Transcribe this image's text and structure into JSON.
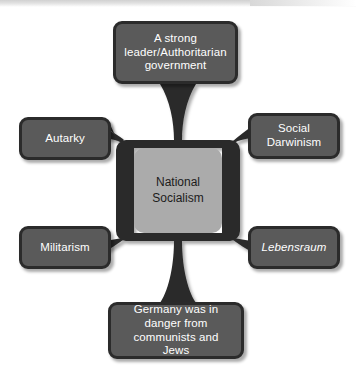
{
  "diagram": {
    "type": "spider-mind-map",
    "center": {
      "label": "National\nSocialism",
      "line1": "National",
      "line2": "Socialism",
      "fill_color": "#ababab",
      "text_color": "#1c1c1c"
    },
    "node_style": {
      "fill_color": "#5a5a5a",
      "border_color": "#2b2b2b",
      "text_color": "#ffffff"
    },
    "background_color": "#ffffff",
    "nodes": [
      {
        "id": "top",
        "position": "top",
        "label": "A strong leader/Authoritarian government",
        "lines": [
          "A strong",
          "leader/Authoritarian",
          "government"
        ],
        "italic": false
      },
      {
        "id": "left-upper",
        "position": "left-upper",
        "label": "Autarky",
        "lines": [
          "Autarky"
        ],
        "italic": false
      },
      {
        "id": "right-upper",
        "position": "right-upper",
        "label": "Social Darwinism",
        "lines": [
          "Social",
          "Darwinism"
        ],
        "italic": false
      },
      {
        "id": "left-lower",
        "position": "left-lower",
        "label": "Militarism",
        "lines": [
          "Militarism"
        ],
        "italic": false
      },
      {
        "id": "right-lower",
        "position": "right-lower",
        "label": "Lebensraum",
        "lines": [
          "Lebensraum"
        ],
        "italic": true
      },
      {
        "id": "bottom",
        "position": "bottom",
        "label": "Germany was in danger from communists and Jews",
        "lines": [
          "Germany was in",
          "danger from",
          "communists and Jews"
        ],
        "italic": false
      }
    ]
  }
}
